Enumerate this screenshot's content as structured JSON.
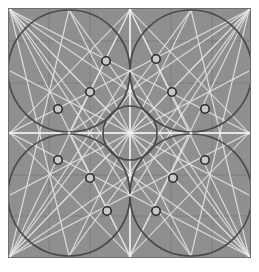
{
  "figure": {
    "type": "diagram",
    "canvas": {
      "width": 259,
      "height": 272
    },
    "plot_area": {
      "x": 8,
      "y": 8,
      "width": 243,
      "height": 250
    },
    "colors": {
      "page_background": "#ffffff",
      "plot_background": "#8f8f8f",
      "grid_line": "#7d7d7d",
      "axis_line": "#f2f2f2",
      "construction_line": "#e8e8e8",
      "construction_line_dim": "#bdbdbd",
      "circle_stroke": "#4a4a4a",
      "marker_stroke": "#2b2b2b",
      "marker_fill": "#c8c8c8",
      "plot_border": "#6f6f6f"
    },
    "grid": {
      "enabled": true,
      "x_lines": [
        49,
        90,
        171,
        212
      ],
      "y_lines": [
        41,
        83,
        175,
        216
      ]
    },
    "axes": {
      "center_x": 130,
      "center_y": 133,
      "show_center_cross": true
    },
    "circles": [
      {
        "name": "quadrant-circle-top-left",
        "cx": 69,
        "cy": 71,
        "r": 61
      },
      {
        "name": "quadrant-circle-top-right",
        "cx": 191,
        "cy": 71,
        "r": 61
      },
      {
        "name": "quadrant-circle-bottom-left",
        "cx": 69,
        "cy": 195,
        "r": 61
      },
      {
        "name": "quadrant-circle-bottom-right",
        "cx": 191,
        "cy": 195,
        "r": 61
      },
      {
        "name": "center-circle",
        "cx": 130,
        "cy": 133,
        "r": 27
      }
    ],
    "markers": [
      {
        "name": "marker-tl-1",
        "cx": 106,
        "cy": 61,
        "r": 4.2,
        "quadrant": "top-left"
      },
      {
        "name": "marker-tl-2",
        "cx": 90,
        "cy": 92,
        "r": 4.2,
        "quadrant": "top-left"
      },
      {
        "name": "marker-tl-3",
        "cx": 58,
        "cy": 109,
        "r": 4.2,
        "quadrant": "top-left"
      },
      {
        "name": "marker-tr-1",
        "cx": 156,
        "cy": 59,
        "r": 4.2,
        "quadrant": "top-right"
      },
      {
        "name": "marker-tr-2",
        "cx": 172,
        "cy": 92,
        "r": 4.2,
        "quadrant": "top-right"
      },
      {
        "name": "marker-tr-3",
        "cx": 205,
        "cy": 109,
        "r": 4.2,
        "quadrant": "top-right"
      },
      {
        "name": "marker-bl-1",
        "cx": 58,
        "cy": 160,
        "r": 4.2,
        "quadrant": "bottom-left"
      },
      {
        "name": "marker-bl-2",
        "cx": 90,
        "cy": 178,
        "r": 4.2,
        "quadrant": "bottom-left"
      },
      {
        "name": "marker-bl-3",
        "cx": 107,
        "cy": 211,
        "r": 4.2,
        "quadrant": "bottom-left"
      },
      {
        "name": "marker-br-1",
        "cx": 205,
        "cy": 160,
        "r": 4.2,
        "quadrant": "bottom-right"
      },
      {
        "name": "marker-br-2",
        "cx": 173,
        "cy": 178,
        "r": 4.2,
        "quadrant": "bottom-right"
      },
      {
        "name": "marker-br-3",
        "cx": 156,
        "cy": 211,
        "r": 4.2,
        "quadrant": "bottom-right"
      }
    ],
    "node_points": [
      {
        "name": "node-corner-tl",
        "x": 10,
        "y": 10
      },
      {
        "name": "node-corner-tr",
        "x": 249,
        "y": 10
      },
      {
        "name": "node-corner-bl",
        "x": 10,
        "y": 256
      },
      {
        "name": "node-corner-br",
        "x": 249,
        "y": 256
      },
      {
        "name": "node-top-mid",
        "x": 130,
        "y": 10
      },
      {
        "name": "node-bottom-mid",
        "x": 130,
        "y": 256
      },
      {
        "name": "node-left-mid",
        "x": 10,
        "y": 133
      },
      {
        "name": "node-right-mid",
        "x": 249,
        "y": 133
      },
      {
        "name": "node-center",
        "x": 130,
        "y": 133
      },
      {
        "name": "node-inner-top",
        "x": 130,
        "y": 71
      },
      {
        "name": "node-inner-bottom",
        "x": 130,
        "y": 195
      },
      {
        "name": "node-inner-left",
        "x": 69,
        "y": 133
      },
      {
        "name": "node-inner-right",
        "x": 191,
        "y": 133
      }
    ],
    "construction_lines": [
      {
        "x1": 10,
        "y1": 10,
        "x2": 249,
        "y2": 256
      },
      {
        "x1": 249,
        "y1": 10,
        "x2": 10,
        "y2": 256
      },
      {
        "x1": 10,
        "y1": 10,
        "x2": 130,
        "y2": 256
      },
      {
        "x1": 249,
        "y1": 10,
        "x2": 130,
        "y2": 256
      },
      {
        "x1": 10,
        "y1": 256,
        "x2": 130,
        "y2": 10
      },
      {
        "x1": 249,
        "y1": 256,
        "x2": 130,
        "y2": 10
      },
      {
        "x1": 10,
        "y1": 10,
        "x2": 249,
        "y2": 133
      },
      {
        "x1": 10,
        "y1": 10,
        "x2": 130,
        "y2": 133
      },
      {
        "x1": 249,
        "y1": 10,
        "x2": 10,
        "y2": 133
      },
      {
        "x1": 249,
        "y1": 10,
        "x2": 130,
        "y2": 133
      },
      {
        "x1": 10,
        "y1": 256,
        "x2": 249,
        "y2": 133
      },
      {
        "x1": 10,
        "y1": 256,
        "x2": 130,
        "y2": 133
      },
      {
        "x1": 249,
        "y1": 256,
        "x2": 10,
        "y2": 133
      },
      {
        "x1": 249,
        "y1": 256,
        "x2": 130,
        "y2": 133
      },
      {
        "x1": 10,
        "y1": 10,
        "x2": 69,
        "y2": 256
      },
      {
        "x1": 10,
        "y1": 10,
        "x2": 191,
        "y2": 256
      },
      {
        "x1": 249,
        "y1": 10,
        "x2": 191,
        "y2": 256
      },
      {
        "x1": 249,
        "y1": 10,
        "x2": 69,
        "y2": 256
      },
      {
        "x1": 10,
        "y1": 256,
        "x2": 69,
        "y2": 10
      },
      {
        "x1": 10,
        "y1": 256,
        "x2": 191,
        "y2": 10
      },
      {
        "x1": 249,
        "y1": 256,
        "x2": 191,
        "y2": 10
      },
      {
        "x1": 249,
        "y1": 256,
        "x2": 69,
        "y2": 10
      },
      {
        "x1": 10,
        "y1": 133,
        "x2": 130,
        "y2": 10
      },
      {
        "x1": 10,
        "y1": 133,
        "x2": 130,
        "y2": 256
      },
      {
        "x1": 249,
        "y1": 133,
        "x2": 130,
        "y2": 10
      },
      {
        "x1": 249,
        "y1": 133,
        "x2": 130,
        "y2": 256
      },
      {
        "x1": 130,
        "y1": 10,
        "x2": 69,
        "y2": 133
      },
      {
        "x1": 130,
        "y1": 10,
        "x2": 191,
        "y2": 133
      },
      {
        "x1": 130,
        "y1": 256,
        "x2": 69,
        "y2": 133
      },
      {
        "x1": 130,
        "y1": 256,
        "x2": 191,
        "y2": 133
      },
      {
        "x1": 10,
        "y1": 10,
        "x2": 130,
        "y2": 195
      },
      {
        "x1": 249,
        "y1": 10,
        "x2": 130,
        "y2": 195
      },
      {
        "x1": 10,
        "y1": 256,
        "x2": 130,
        "y2": 71
      },
      {
        "x1": 249,
        "y1": 256,
        "x2": 130,
        "y2": 71
      },
      {
        "x1": 10,
        "y1": 10,
        "x2": 191,
        "y2": 133
      },
      {
        "x1": 249,
        "y1": 10,
        "x2": 69,
        "y2": 133
      },
      {
        "x1": 10,
        "y1": 256,
        "x2": 191,
        "y2": 133
      },
      {
        "x1": 249,
        "y1": 256,
        "x2": 69,
        "y2": 133
      },
      {
        "x1": 69,
        "y1": 10,
        "x2": 130,
        "y2": 133
      },
      {
        "x1": 191,
        "y1": 10,
        "x2": 130,
        "y2": 133
      },
      {
        "x1": 69,
        "y1": 256,
        "x2": 130,
        "y2": 133
      },
      {
        "x1": 191,
        "y1": 256,
        "x2": 130,
        "y2": 133
      },
      {
        "x1": 10,
        "y1": 71,
        "x2": 130,
        "y2": 133
      },
      {
        "x1": 249,
        "y1": 71,
        "x2": 130,
        "y2": 133
      },
      {
        "x1": 10,
        "y1": 195,
        "x2": 130,
        "y2": 133
      },
      {
        "x1": 249,
        "y1": 195,
        "x2": 130,
        "y2": 133
      },
      {
        "x1": 130,
        "y1": 10,
        "x2": 130,
        "y2": 256
      },
      {
        "x1": 10,
        "y1": 133,
        "x2": 249,
        "y2": 133
      }
    ]
  }
}
